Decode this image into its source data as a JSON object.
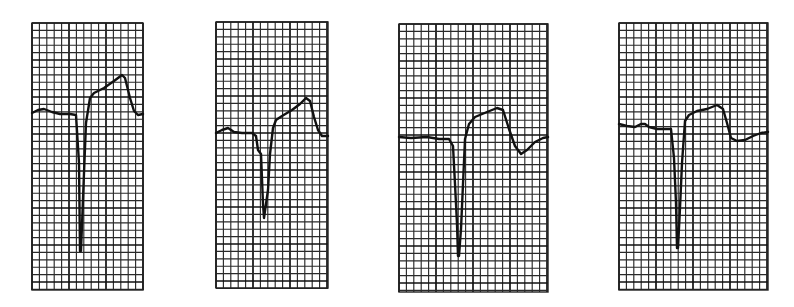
{
  "figure": {
    "background": "#ffffff",
    "grid_color": "#222222",
    "trace_color": "#111111",
    "grid_small_square_px": 7.4,
    "grid_major_every": 5
  },
  "strips": [
    {
      "id": "strip-1",
      "box": {
        "x": 32,
        "y": 23,
        "w": 111,
        "h": 267
      },
      "trace": [
        [
          0,
          90
        ],
        [
          6,
          87
        ],
        [
          12,
          86
        ],
        [
          20,
          89
        ],
        [
          28,
          91
        ],
        [
          38,
          91
        ],
        [
          44,
          92
        ],
        [
          47,
          140
        ],
        [
          48,
          228
        ],
        [
          49,
          228
        ],
        [
          52,
          150
        ],
        [
          54,
          100
        ],
        [
          58,
          75
        ],
        [
          62,
          70
        ],
        [
          72,
          65
        ],
        [
          82,
          58
        ],
        [
          90,
          52
        ],
        [
          93,
          55
        ],
        [
          98,
          75
        ],
        [
          102,
          88
        ],
        [
          106,
          92
        ],
        [
          111,
          91
        ]
      ]
    },
    {
      "id": "strip-2",
      "box": {
        "x": 216,
        "y": 22,
        "w": 112,
        "h": 266
      },
      "trace": [
        [
          0,
          111
        ],
        [
          6,
          108
        ],
        [
          12,
          106
        ],
        [
          18,
          110
        ],
        [
          26,
          111
        ],
        [
          36,
          111
        ],
        [
          40,
          114
        ],
        [
          42,
          128
        ],
        [
          45,
          132
        ],
        [
          47,
          182
        ],
        [
          48,
          196
        ],
        [
          50,
          182
        ],
        [
          52,
          168
        ],
        [
          54,
          132
        ],
        [
          57,
          106
        ],
        [
          60,
          98
        ],
        [
          66,
          94
        ],
        [
          76,
          88
        ],
        [
          84,
          82
        ],
        [
          90,
          76
        ],
        [
          94,
          79
        ],
        [
          98,
          95
        ],
        [
          102,
          108
        ],
        [
          106,
          114
        ],
        [
          112,
          114
        ]
      ]
    },
    {
      "id": "strip-3",
      "box": {
        "x": 399,
        "y": 24,
        "w": 149,
        "h": 268
      },
      "trace": [
        [
          0,
          113
        ],
        [
          12,
          114
        ],
        [
          28,
          113
        ],
        [
          40,
          115
        ],
        [
          50,
          115
        ],
        [
          54,
          122
        ],
        [
          56,
          160
        ],
        [
          58,
          200
        ],
        [
          59,
          232
        ],
        [
          60,
          232
        ],
        [
          62,
          205
        ],
        [
          64,
          160
        ],
        [
          66,
          115
        ],
        [
          70,
          100
        ],
        [
          76,
          93
        ],
        [
          88,
          88
        ],
        [
          98,
          84
        ],
        [
          104,
          86
        ],
        [
          110,
          105
        ],
        [
          116,
          122
        ],
        [
          122,
          130
        ],
        [
          128,
          126
        ],
        [
          136,
          118
        ],
        [
          144,
          114
        ],
        [
          149,
          113
        ]
      ]
    },
    {
      "id": "strip-4",
      "box": {
        "x": 619,
        "y": 23,
        "w": 149,
        "h": 267
      },
      "trace": [
        [
          0,
          101
        ],
        [
          8,
          103
        ],
        [
          16,
          104
        ],
        [
          22,
          101
        ],
        [
          26,
          101
        ],
        [
          30,
          104
        ],
        [
          38,
          106
        ],
        [
          46,
          106
        ],
        [
          52,
          106
        ],
        [
          55,
          135
        ],
        [
          57,
          180
        ],
        [
          58,
          225
        ],
        [
          59,
          225
        ],
        [
          61,
          185
        ],
        [
          63,
          140
        ],
        [
          66,
          98
        ],
        [
          70,
          92
        ],
        [
          78,
          88
        ],
        [
          88,
          86
        ],
        [
          98,
          82
        ],
        [
          104,
          86
        ],
        [
          108,
          100
        ],
        [
          112,
          115
        ],
        [
          118,
          118
        ],
        [
          126,
          117
        ],
        [
          134,
          113
        ],
        [
          142,
          110
        ],
        [
          149,
          109
        ]
      ]
    }
  ]
}
